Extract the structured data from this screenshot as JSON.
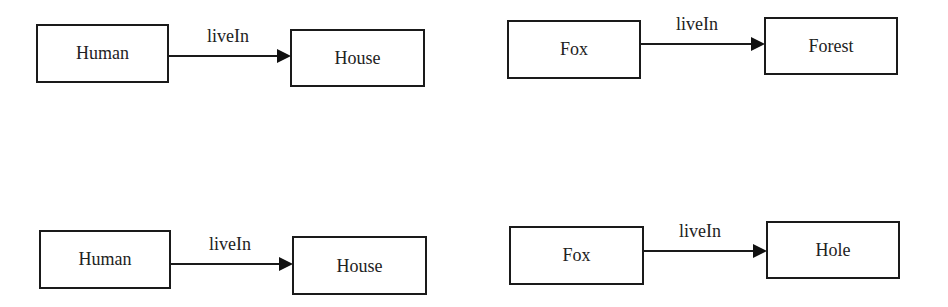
{
  "diagram": {
    "type": "relation-graphs",
    "graphs": [
      {
        "id": "graph-top-left",
        "source": {
          "label": "Human"
        },
        "target": {
          "label": "House"
        },
        "edge": {
          "label": "liveIn"
        }
      },
      {
        "id": "graph-top-right",
        "source": {
          "label": "Fox"
        },
        "target": {
          "label": "Forest"
        },
        "edge": {
          "label": "liveIn"
        }
      },
      {
        "id": "graph-bottom-left",
        "source": {
          "label": "Human"
        },
        "target": {
          "label": "House"
        },
        "edge": {
          "label": "liveIn"
        }
      },
      {
        "id": "graph-bottom-right",
        "source": {
          "label": "Fox"
        },
        "target": {
          "label": "Hole"
        },
        "edge": {
          "label": "liveIn"
        }
      }
    ]
  }
}
